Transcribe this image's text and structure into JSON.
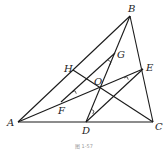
{
  "diagram": {
    "type": "geometry-triangle",
    "caption": "图 1-57",
    "points": {
      "A": {
        "label": "A",
        "x": 18,
        "y": 122
      },
      "B": {
        "label": "B",
        "x": 130,
        "y": 16
      },
      "C": {
        "label": "C",
        "x": 153,
        "y": 122
      },
      "D": {
        "label": "D",
        "x": 86,
        "y": 122
      },
      "E": {
        "label": "E",
        "x": 143,
        "y": 69
      },
      "F": {
        "label": "F",
        "x": 61,
        "y": 102
      },
      "G": {
        "label": "G",
        "x": 115,
        "y": 53
      },
      "H": {
        "label": "H",
        "x": 73,
        "y": 70
      },
      "O": {
        "label": "O",
        "x": 101,
        "y": 86
      }
    },
    "segments": [
      "AB",
      "BC",
      "AC",
      "BD",
      "AE",
      "HC",
      "FG",
      "DE"
    ],
    "right_angle_marks": [
      "F",
      "G",
      "D",
      "E"
    ]
  }
}
